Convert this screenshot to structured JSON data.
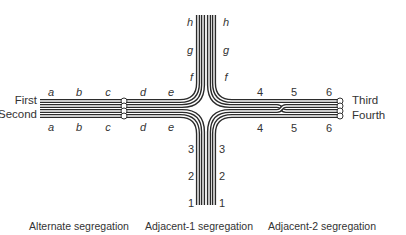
{
  "diagram": {
    "type": "meiotic-quadrivalent-cross",
    "chromosomes": [
      {
        "id": "first",
        "label": "First"
      },
      {
        "id": "second",
        "label": "Second"
      },
      {
        "id": "third",
        "label": "Third"
      },
      {
        "id": "fourth",
        "label": "Fourth"
      }
    ],
    "left_arm_top_loci": [
      "a",
      "b",
      "c",
      "d",
      "e"
    ],
    "left_arm_bottom_loci": [
      "a",
      "b",
      "c",
      "d",
      "e"
    ],
    "top_arm_left_loci": [
      "h",
      "g",
      "f"
    ],
    "top_arm_right_loci": [
      "h",
      "g",
      "f"
    ],
    "right_arm_top_loci": [
      "4",
      "5",
      "6"
    ],
    "right_arm_bottom_loci": [
      "4",
      "5",
      "6"
    ],
    "bottom_arm_left_loci": [
      "3",
      "2",
      "1"
    ],
    "bottom_arm_right_loci": [
      "3",
      "2",
      "1"
    ],
    "captions": [
      "Alternate segregation",
      "Adjacent-1 segregation",
      "Adjacent-2 segregation"
    ],
    "colors": {
      "line": "#2b2b2b",
      "text": "#333333",
      "background": "#ffffff"
    }
  }
}
